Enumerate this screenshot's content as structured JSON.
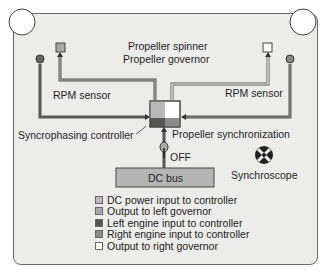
{
  "diagram": {
    "title_line1": "Propeller spinner",
    "title_line2": "Propeller governor",
    "rpm_sensor_left": "RPM sensor",
    "rpm_sensor_right": "RPM sensor",
    "controller_label": "Syncrophasing controller",
    "sync_label": "Propeller synchronization",
    "switch_label": "OFF",
    "bus_label": "DC bus",
    "synchroscope_label": "Synchroscope"
  },
  "legend": {
    "items": [
      {
        "label": "DC power input to controller",
        "color": "#b8b8b8"
      },
      {
        "label": "Output to left governor",
        "color": "#a9a9a9"
      },
      {
        "label": "Left engine input to controller",
        "color": "#555555"
      },
      {
        "label": "Right engine input to controller",
        "color": "#8a8a8a"
      },
      {
        "label": "Output to right governor",
        "color": "#ffffff"
      }
    ]
  },
  "colors": {
    "background": "#ececea",
    "line": "#555555",
    "bus": "#b5b5b5"
  }
}
